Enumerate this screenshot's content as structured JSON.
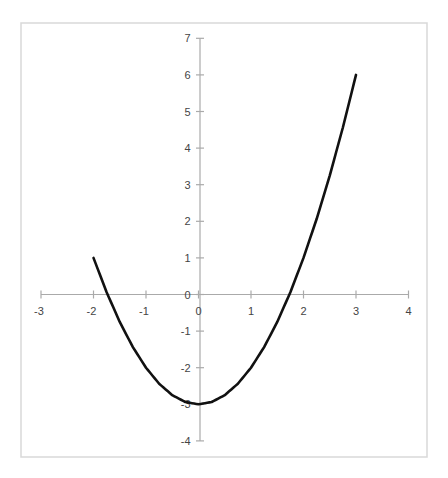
{
  "chart_data": {
    "type": "line",
    "title": "",
    "xlabel": "",
    "ylabel": "",
    "function": "y = x^2 - 3",
    "xlim": [
      -3,
      4
    ],
    "ylim": [
      -4,
      7
    ],
    "grid": false,
    "legend": null,
    "x_ticks": [
      -3,
      -2,
      -1,
      0,
      1,
      2,
      3,
      4
    ],
    "y_ticks": [
      -4,
      -3,
      -2,
      -1,
      0,
      1,
      2,
      3,
      4,
      5,
      6,
      7
    ],
    "series": [
      {
        "name": "y = x^2 - 3",
        "color": "#111111",
        "x": [
          -2,
          -1.75,
          -1.5,
          -1.25,
          -1,
          -0.75,
          -0.5,
          -0.25,
          0,
          0.25,
          0.5,
          0.75,
          1,
          1.25,
          1.5,
          1.75,
          2,
          2.25,
          2.5,
          2.75,
          3
        ],
        "y": [
          1,
          0.0625,
          -0.75,
          -1.4375,
          -2,
          -2.4375,
          -2.75,
          -2.9375,
          -3,
          -2.9375,
          -2.75,
          -2.4375,
          -2,
          -1.4375,
          -0.75,
          0.0625,
          1,
          2.0625,
          3.25,
          4.5625,
          6
        ]
      }
    ]
  },
  "colors": {
    "curve": "#111111",
    "axis": "#aaaaaa",
    "border": "#d9d9d9",
    "label": "#444444"
  },
  "layout": {
    "plot": {
      "left": 21,
      "top": 23,
      "right": 427,
      "bottom": 457
    },
    "x_origin_px": 198.5,
    "y_origin_px": 294.5,
    "x_unit_px": 52.5,
    "y_unit_px": 36.6
  }
}
